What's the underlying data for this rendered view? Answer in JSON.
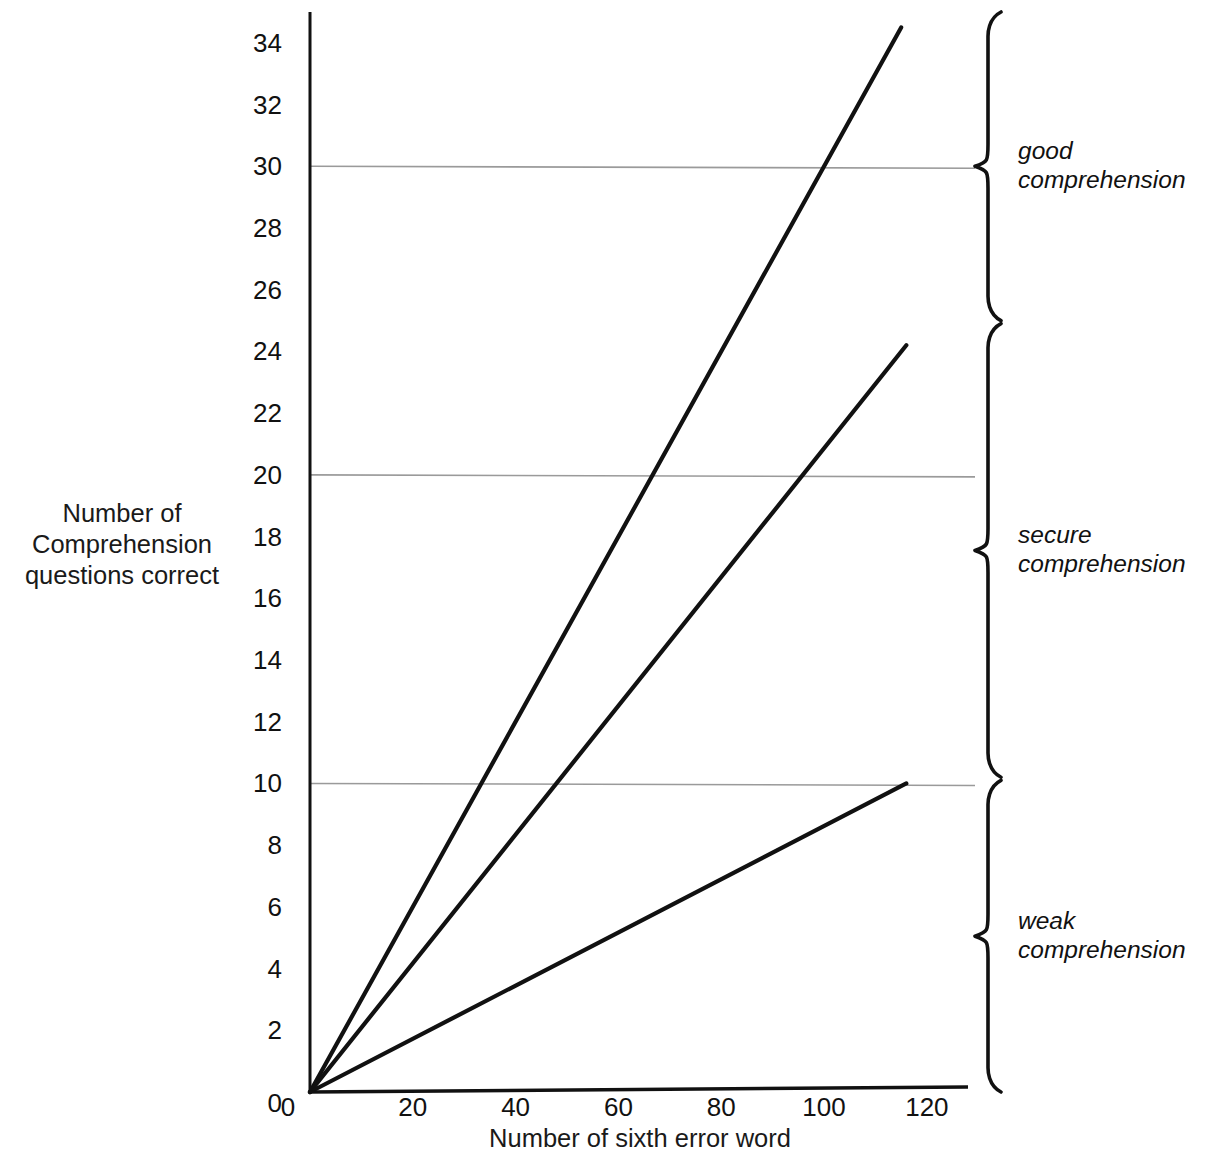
{
  "chart_data": {
    "type": "line",
    "title": "",
    "xlabel": "Number of sixth error word",
    "ylabel": "Number of\nComprehension\nquestions correct",
    "xlim": [
      0,
      128
    ],
    "ylim": [
      0,
      35
    ],
    "xticks": [
      0,
      20,
      40,
      60,
      80,
      100,
      120
    ],
    "xtick_labels": [
      "0",
      "20",
      "40",
      "60",
      "80",
      "100",
      "120"
    ],
    "yticks": [
      0,
      2,
      4,
      6,
      8,
      10,
      12,
      14,
      16,
      18,
      20,
      22,
      24,
      26,
      28,
      30,
      32,
      34
    ],
    "ytick_labels": [
      "0",
      "2",
      "4",
      "6",
      "8",
      "10",
      "12",
      "14",
      "16",
      "18",
      "20",
      "22",
      "24",
      "26",
      "28",
      "30",
      "32",
      "34"
    ],
    "grid": true,
    "gridlines_y": [
      10,
      20,
      30
    ],
    "legend_position": "none",
    "line_color": "#111111",
    "grid_color": "#9a9a9a",
    "axis_color": "#111111",
    "series": [
      {
        "name": "steep line",
        "x": [
          0,
          115
        ],
        "y": [
          0,
          34.5
        ],
        "slope": 0.3
      },
      {
        "name": "middle line",
        "x": [
          0,
          116
        ],
        "y": [
          0,
          24.2
        ],
        "slope": 0.2086
      },
      {
        "name": "shallow line",
        "x": [
          0,
          116
        ],
        "y": [
          0,
          10.0
        ],
        "slope": 0.0862
      }
    ],
    "annotations": [
      {
        "label": "good\ncomprehension",
        "y_range": [
          25,
          35
        ]
      },
      {
        "label": "secure\ncomprehension",
        "y_range": [
          10.2,
          24.9
        ]
      },
      {
        "label": "weak\ncomprehension",
        "y_range": [
          0,
          10.1
        ]
      }
    ]
  },
  "axes": {
    "y_title": "Number of\nComprehension\nquestions correct",
    "x_title": "Number of sixth error word"
  },
  "bands": [
    {
      "name": "good",
      "label": "good\ncomprehension"
    },
    {
      "name": "secure",
      "label": "secure\ncomprehension"
    },
    {
      "name": "weak",
      "label": "weak\ncomprehension"
    }
  ]
}
